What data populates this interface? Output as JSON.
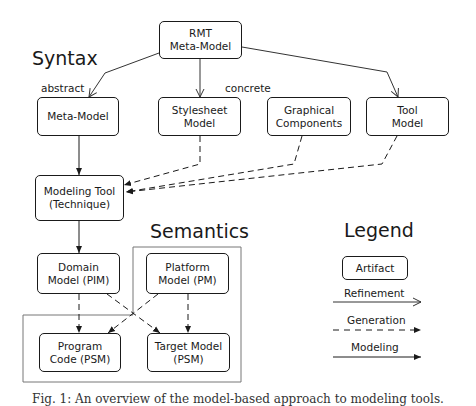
{
  "sections": {
    "syntax": "Syntax",
    "semantics": "Semantics",
    "legend": "Legend"
  },
  "groups": {
    "abstract": "abstract",
    "concrete": "concrete"
  },
  "nodes": {
    "rmt": "RMT\nMeta-Model",
    "meta_model": "Meta-Model",
    "stylesheet": "Stylesheet\nModel",
    "graphical": "Graphical\nComponents",
    "tool_model": "Tool\nModel",
    "modeling_tool": "Modeling Tool\n(Technique)",
    "domain_model": "Domain\nModel (PIM)",
    "platform_model": "Platform\nModel (PM)",
    "program_code": "Program\nCode (PSM)",
    "target_model": "Target Model\n(PSM)"
  },
  "legend": {
    "artifact": "Artifact",
    "refinement": "Refinement",
    "generation": "Generation",
    "modeling": "Modeling"
  },
  "edges": [
    {
      "from": "rmt",
      "to": "meta_model",
      "type": "refinement"
    },
    {
      "from": "rmt",
      "to": "stylesheet",
      "type": "refinement"
    },
    {
      "from": "rmt",
      "to": "tool_model",
      "type": "refinement"
    },
    {
      "from": "meta_model",
      "to": "modeling_tool",
      "type": "modeling"
    },
    {
      "from": "stylesheet",
      "to": "modeling_tool",
      "type": "generation"
    },
    {
      "from": "graphical",
      "to": "modeling_tool",
      "type": "generation"
    },
    {
      "from": "tool_model",
      "to": "modeling_tool",
      "type": "generation"
    },
    {
      "from": "modeling_tool",
      "to": "domain_model",
      "type": "modeling"
    },
    {
      "from": "domain_model",
      "to": "program_code",
      "type": "generation"
    },
    {
      "from": "domain_model",
      "to": "target_model",
      "type": "generation"
    },
    {
      "from": "platform_model",
      "to": "program_code",
      "type": "generation"
    },
    {
      "from": "platform_model",
      "to": "target_model",
      "type": "generation"
    }
  ],
  "caption": "Fig. 1: An overview of the model-based approach to modeling tools."
}
